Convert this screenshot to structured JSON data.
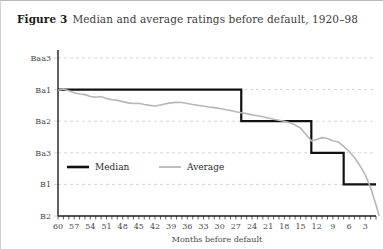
{
  "figure": {
    "label": "Figure 3",
    "caption": "Median and average ratings before default, 1920–98"
  },
  "colors": {
    "median_line": "#111111",
    "average_line": "#b7b7b7",
    "axis": "#1e1e1e",
    "gridline": "#cccccc",
    "tick_text": "#4a4a4a",
    "caption_label": "#1a1a1a",
    "caption_text": "#3b3b3b",
    "frame_top": "#b9b9bd",
    "frame_left": "#cfcfd4",
    "background": "#ffffff"
  },
  "chart_data": {
    "type": "line",
    "title": "Median and average ratings before default, 1920–98",
    "xlabel": "Months before default",
    "ylabel": "",
    "grid": true,
    "legend_position": "inside-lower-left",
    "x_axis": {
      "tick_labels": [
        "60",
        "57",
        "54",
        "51",
        "48",
        "45",
        "42",
        "39",
        "36",
        "33",
        "30",
        "27",
        "24",
        "21",
        "18",
        "15",
        "12",
        "9",
        "6",
        "3"
      ],
      "tick_values": [
        60,
        57,
        54,
        51,
        48,
        45,
        42,
        39,
        36,
        33,
        30,
        27,
        24,
        21,
        18,
        15,
        12,
        9,
        6,
        3
      ],
      "minor_tick_interval": 1,
      "range": [
        60,
        1
      ],
      "direction": "descending"
    },
    "y_axis": {
      "tick_labels": [
        "Baa3",
        "Ba1",
        "Ba2",
        "Ba3",
        "B1",
        "B2"
      ],
      "tick_levels": [
        0,
        1,
        2,
        3,
        4,
        5
      ],
      "range": [
        "Baa3",
        "B2"
      ],
      "note": "Rating scale, higher on chart is better credit quality"
    },
    "series": [
      {
        "name": "Median",
        "style": "step",
        "color": "#111111",
        "width": 2.2,
        "points": [
          {
            "x": 60,
            "y": "Ba1"
          },
          {
            "x": 55,
            "y": "Ba1"
          },
          {
            "x": 50,
            "y": "Ba1"
          },
          {
            "x": 45,
            "y": "Ba1"
          },
          {
            "x": 40,
            "y": "Ba1"
          },
          {
            "x": 35,
            "y": "Ba1"
          },
          {
            "x": 30,
            "y": "Ba1"
          },
          {
            "x": 27,
            "y": "Ba1"
          },
          {
            "x": 26,
            "y": "Ba2"
          },
          {
            "x": 22,
            "y": "Ba2"
          },
          {
            "x": 18,
            "y": "Ba2"
          },
          {
            "x": 14,
            "y": "Ba2"
          },
          {
            "x": 13,
            "y": "Ba3"
          },
          {
            "x": 10,
            "y": "Ba3"
          },
          {
            "x": 8,
            "y": "Ba3"
          },
          {
            "x": 7,
            "y": "B1"
          },
          {
            "x": 4,
            "y": "B1"
          },
          {
            "x": 1,
            "y": "B1"
          }
        ]
      },
      {
        "name": "Average",
        "style": "line",
        "color": "#b7b7b7",
        "width": 1.6,
        "points": [
          {
            "x": 60,
            "y_level": 1.02
          },
          {
            "x": 59,
            "y_level": 0.98
          },
          {
            "x": 58,
            "y_level": 1.04
          },
          {
            "x": 57,
            "y_level": 1.1
          },
          {
            "x": 56,
            "y_level": 1.14
          },
          {
            "x": 55,
            "y_level": 1.16
          },
          {
            "x": 54,
            "y_level": 1.22
          },
          {
            "x": 53,
            "y_level": 1.24
          },
          {
            "x": 52,
            "y_level": 1.22
          },
          {
            "x": 51,
            "y_level": 1.28
          },
          {
            "x": 50,
            "y_level": 1.32
          },
          {
            "x": 49,
            "y_level": 1.34
          },
          {
            "x": 48,
            "y_level": 1.38
          },
          {
            "x": 47,
            "y_level": 1.42
          },
          {
            "x": 46,
            "y_level": 1.44
          },
          {
            "x": 45,
            "y_level": 1.43
          },
          {
            "x": 44,
            "y_level": 1.47
          },
          {
            "x": 43,
            "y_level": 1.5
          },
          {
            "x": 42,
            "y_level": 1.52
          },
          {
            "x": 41,
            "y_level": 1.49
          },
          {
            "x": 40,
            "y_level": 1.45
          },
          {
            "x": 39,
            "y_level": 1.42
          },
          {
            "x": 38,
            "y_level": 1.4
          },
          {
            "x": 37,
            "y_level": 1.41
          },
          {
            "x": 36,
            "y_level": 1.44
          },
          {
            "x": 35,
            "y_level": 1.47
          },
          {
            "x": 34,
            "y_level": 1.5
          },
          {
            "x": 33,
            "y_level": 1.52
          },
          {
            "x": 32,
            "y_level": 1.55
          },
          {
            "x": 31,
            "y_level": 1.57
          },
          {
            "x": 30,
            "y_level": 1.6
          },
          {
            "x": 29,
            "y_level": 1.63
          },
          {
            "x": 28,
            "y_level": 1.66
          },
          {
            "x": 27,
            "y_level": 1.7
          },
          {
            "x": 26,
            "y_level": 1.73
          },
          {
            "x": 25,
            "y_level": 1.76
          },
          {
            "x": 24,
            "y_level": 1.8
          },
          {
            "x": 23,
            "y_level": 1.83
          },
          {
            "x": 22,
            "y_level": 1.86
          },
          {
            "x": 21,
            "y_level": 1.9
          },
          {
            "x": 20,
            "y_level": 1.94
          },
          {
            "x": 19,
            "y_level": 1.97
          },
          {
            "x": 18,
            "y_level": 2.0
          },
          {
            "x": 17,
            "y_level": 2.05
          },
          {
            "x": 16,
            "y_level": 2.12
          },
          {
            "x": 15,
            "y_level": 2.22
          },
          {
            "x": 14,
            "y_level": 2.42
          },
          {
            "x": 13,
            "y_level": 2.62
          },
          {
            "x": 12,
            "y_level": 2.58
          },
          {
            "x": 11,
            "y_level": 2.52
          },
          {
            "x": 10,
            "y_level": 2.55
          },
          {
            "x": 9,
            "y_level": 2.62
          },
          {
            "x": 8,
            "y_level": 2.66
          },
          {
            "x": 7,
            "y_level": 2.8
          },
          {
            "x": 6,
            "y_level": 2.95
          },
          {
            "x": 5,
            "y_level": 3.15
          },
          {
            "x": 4,
            "y_level": 3.4
          },
          {
            "x": 3,
            "y_level": 3.7
          },
          {
            "x": 2,
            "y_level": 4.1
          },
          {
            "x": 1,
            "y_level": 4.65
          },
          {
            "x": 0.4,
            "y_level": 5.0
          }
        ]
      }
    ],
    "legend": [
      {
        "label": "Median",
        "color": "#111111",
        "width": 2.6
      },
      {
        "label": "Average",
        "color": "#b7b7b7",
        "width": 1.8
      }
    ]
  }
}
